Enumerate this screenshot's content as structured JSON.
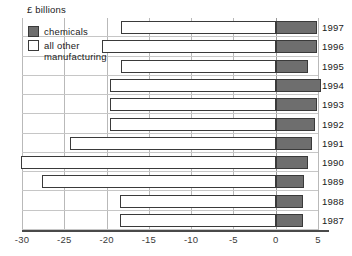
{
  "axis_title": "£ billions",
  "legend": {
    "items": [
      {
        "label": "chemicals",
        "swatch": "dark-square-icon",
        "color": "#6e6e6e"
      },
      {
        "label": "all other\nmanufacturing",
        "swatch": "white-square-icon",
        "color": "#ffffff"
      }
    ]
  },
  "colors": {
    "chemicals": "#6e6e6e",
    "other_manufacturing": "#ffffff",
    "bar_outline": "#3a3a3a",
    "gridline": "#b9b9b9",
    "axis": "#4a4a4a"
  },
  "chart_data": {
    "type": "bar",
    "orientation": "horizontal",
    "stacked": true,
    "title": "",
    "subtitle": "",
    "xlabel": "£ billions",
    "ylabel": "",
    "xlim": [
      -30,
      5
    ],
    "xticks": [
      -30,
      -25,
      -20,
      -15,
      -10,
      -5,
      0,
      5
    ],
    "xtick_labels": [
      "-30",
      "-25",
      "-20",
      "-15",
      "-10",
      "-5",
      "0",
      "5"
    ],
    "grid": true,
    "legend_position": "top-left",
    "categories": [
      "1997",
      "1996",
      "1995",
      "1994",
      "1993",
      "1992",
      "1991",
      "1990",
      "1989",
      "1988",
      "1987"
    ],
    "series": [
      {
        "name": "chemicals",
        "color": "#6e6e6e",
        "values": [
          4.9,
          4.9,
          3.8,
          5.3,
          4.9,
          4.6,
          4.3,
          3.8,
          3.3,
          3.2,
          3.2
        ]
      },
      {
        "name": "all other manufacturing",
        "color": "#ffffff",
        "values": [
          -18.3,
          -20.5,
          -18.3,
          -19.6,
          -19.6,
          -19.6,
          -24.3,
          -30.1,
          -27.6,
          -18.4,
          -18.4
        ]
      }
    ],
    "bars": [
      {
        "year": "1997",
        "chemicals": 4.9,
        "other": -18.3
      },
      {
        "year": "1996",
        "chemicals": 4.9,
        "other": -20.5
      },
      {
        "year": "1995",
        "chemicals": 3.8,
        "other": -18.3
      },
      {
        "year": "1994",
        "chemicals": 5.3,
        "other": -19.6
      },
      {
        "year": "1993",
        "chemicals": 4.9,
        "other": -19.6
      },
      {
        "year": "1992",
        "chemicals": 4.6,
        "other": -19.6
      },
      {
        "year": "1991",
        "chemicals": 4.3,
        "other": -24.3
      },
      {
        "year": "1990",
        "chemicals": 3.8,
        "other": -30.1
      },
      {
        "year": "1989",
        "chemicals": 3.3,
        "other": -27.6
      },
      {
        "year": "1988",
        "chemicals": 3.2,
        "other": -18.4
      },
      {
        "year": "1987",
        "chemicals": 3.2,
        "other": -18.4
      }
    ]
  }
}
